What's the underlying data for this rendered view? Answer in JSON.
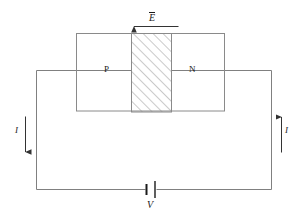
{
  "figure": {
    "labels": {
      "p_region": "P",
      "n_region": "N",
      "field": "E",
      "current_left": "I",
      "current_right": "I",
      "voltage_source": "V"
    },
    "colors": {
      "wire": "#808080",
      "outline": "#8a8a8a",
      "hatch": "#8a8a8a",
      "text": "#1a1a1a",
      "background": "#ffffff",
      "arrow": "#333333"
    },
    "annotations": {
      "field_direction": "left",
      "current_left_direction": "down",
      "current_right_direction": "up"
    }
  }
}
